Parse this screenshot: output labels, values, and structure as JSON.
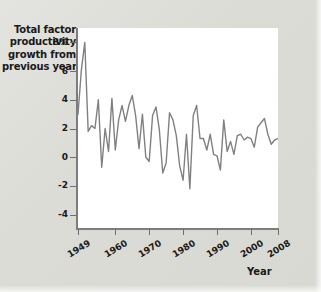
{
  "figure": {
    "background_color": "#dcdcd7",
    "plot_background_color": "#ffffff",
    "axis_color": "#7d7d7d",
    "line_color": "#808080"
  },
  "yaxis_title_lines": [
    "Total factor",
    "productivity",
    "growth from",
    "previous year"
  ],
  "xaxis_title": "Year",
  "chart_data": {
    "type": "line",
    "title": "",
    "subtitle": "",
    "xlabel": "Year",
    "ylabel": "Total factor productivity growth from previous year",
    "xlim": [
      1949,
      2008
    ],
    "ylim": [
      -5,
      9
    ],
    "grid": false,
    "legend": "none",
    "ytick_labels": [
      "8%",
      "6",
      "4",
      "2",
      "0",
      "-2",
      "-4"
    ],
    "ytick_values": [
      8,
      6,
      4,
      2,
      0,
      -2,
      -4
    ],
    "xtick_labels": [
      "1949",
      "1960",
      "1970",
      "1980",
      "1990",
      "2000",
      "2008"
    ],
    "xtick_values": [
      1949,
      1960,
      1970,
      1980,
      1990,
      2000,
      2008
    ],
    "series": [
      {
        "name": "Total factor productivity growth",
        "x": [
          1949,
          1950,
          1951,
          1952,
          1953,
          1954,
          1955,
          1956,
          1957,
          1958,
          1959,
          1960,
          1961,
          1962,
          1963,
          1964,
          1965,
          1966,
          1967,
          1968,
          1969,
          1970,
          1971,
          1972,
          1973,
          1974,
          1975,
          1976,
          1977,
          1978,
          1979,
          1980,
          1981,
          1982,
          1983,
          1984,
          1985,
          1986,
          1987,
          1988,
          1989,
          1990,
          1991,
          1992,
          1993,
          1994,
          1995,
          1996,
          1997,
          1998,
          1999,
          2000,
          2001,
          2002,
          2003,
          2004,
          2005,
          2006,
          2007,
          2008
        ],
        "values": [
          3.0,
          6.1,
          8.0,
          1.8,
          2.2,
          2.0,
          4.0,
          -0.7,
          2.0,
          0.4,
          4.1,
          0.5,
          2.6,
          3.6,
          2.5,
          3.6,
          4.3,
          2.9,
          0.6,
          3.0,
          0.0,
          -0.3,
          2.9,
          3.5,
          1.9,
          -1.1,
          -0.4,
          3.1,
          2.6,
          1.5,
          -0.6,
          -1.6,
          1.6,
          -2.2,
          2.9,
          3.6,
          1.3,
          1.3,
          0.5,
          1.6,
          0.2,
          0.1,
          -0.9,
          2.6,
          0.4,
          1.1,
          0.2,
          1.5,
          1.6,
          1.2,
          1.4,
          1.3,
          0.7,
          2.1,
          2.4,
          2.7,
          1.6,
          0.9,
          1.2,
          1.3
        ]
      }
    ]
  }
}
